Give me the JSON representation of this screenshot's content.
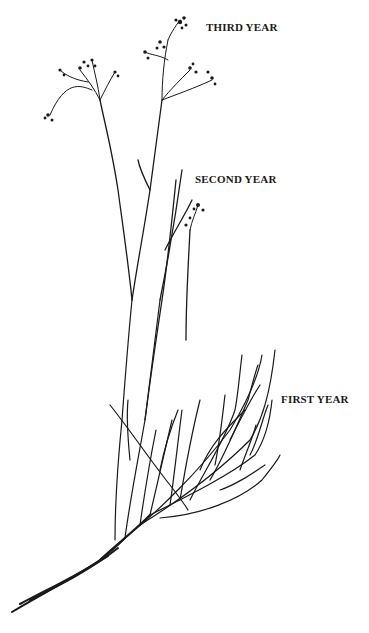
{
  "figure": {
    "labels": {
      "third_year": "THIRD YEAR",
      "second_year": "SECOND YEAR",
      "first_year": "FIRST YEAR"
    },
    "caption": "",
    "colors": {
      "ink": "#1a1a1a",
      "background": "#ffffff"
    }
  }
}
